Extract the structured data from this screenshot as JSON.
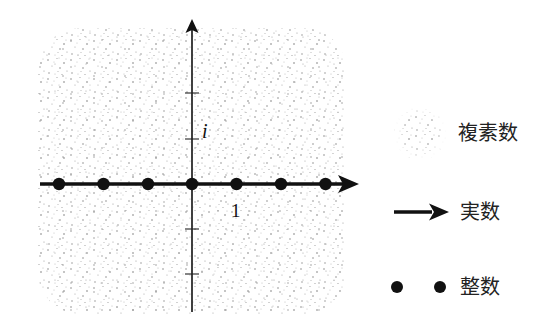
{
  "diagram": {
    "type": "number-set-inclusion-on-complex-plane",
    "plane": {
      "region": "complex-plane",
      "shape": "rounded-rectangle",
      "fill": "stipple",
      "stipple_color": "#8a8a8a"
    },
    "axes": {
      "real_axis": {
        "direction": "horizontal",
        "arrow": true,
        "color": "#111111",
        "unit_label": "1"
      },
      "imaginary_axis": {
        "direction": "vertical",
        "arrow": true,
        "color": "#111111",
        "unit_label": "i"
      },
      "imaginary_ticks": [
        2,
        1,
        -1,
        -2
      ]
    },
    "integer_points": [
      -3,
      -2,
      -1,
      0,
      1,
      2,
      3
    ],
    "legend": [
      {
        "symbol": "stipple-blob",
        "label": "複素数"
      },
      {
        "symbol": "arrow",
        "label": "実数"
      },
      {
        "symbol": "two-dots",
        "label": "整数"
      }
    ]
  }
}
